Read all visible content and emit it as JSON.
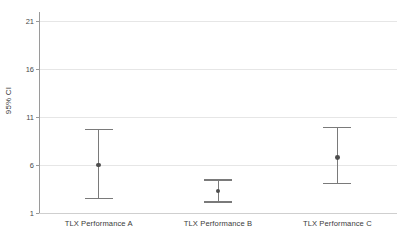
{
  "chart_data": {
    "type": "scatter",
    "title": "",
    "subtitle": "",
    "xlabel": "",
    "ylabel": "95% CI",
    "categories": [
      "TLX Performance A",
      "TLX Performance B",
      "TLX Performance C"
    ],
    "yticks": [
      1,
      6,
      11,
      16,
      21
    ],
    "ytick_labels": [
      "1",
      "6",
      "11",
      "16",
      "21"
    ],
    "ylim": [
      1,
      21
    ],
    "grid": true,
    "legend": false,
    "series": [
      {
        "name": "95% CI",
        "points": [
          {
            "category": "TLX Performance A",
            "mean": 6.0,
            "ci_lower": 2.6,
            "ci_upper": 9.8
          },
          {
            "category": "TLX Performance B",
            "mean": 3.3,
            "ci_lower": 2.2,
            "ci_upper": 4.5
          },
          {
            "category": "TLX Performance C",
            "mean": 6.8,
            "ci_lower": 4.1,
            "ci_upper": 10.0
          }
        ]
      }
    ],
    "marker_color": "#4d4d4d",
    "line_color": "#7a7a7a",
    "grid_color": "#e6e6e6",
    "background": "#ffffff"
  },
  "axis": {
    "y_title": "95% CI"
  }
}
